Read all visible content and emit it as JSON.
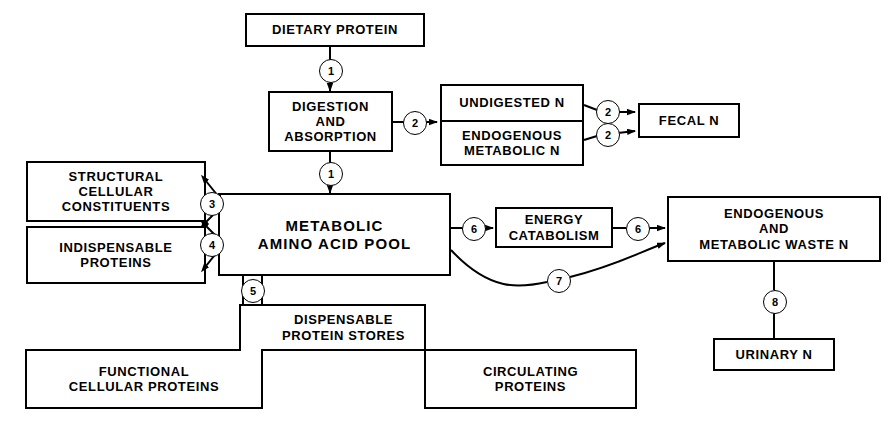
{
  "diagram": {
    "stroke_color": "#000000",
    "background_color": "#ffffff",
    "nodes": [
      {
        "id": "dietary-protein",
        "label": "DIETARY PROTEIN"
      },
      {
        "id": "digestion-and-absorption",
        "label": "DIGESTION\nAND\nABSORPTION"
      },
      {
        "id": "undigested-n",
        "label": "UNDIGESTED N"
      },
      {
        "id": "endogenous-metabolic-n",
        "label": "ENDOGENOUS\nMETABOLIC N"
      },
      {
        "id": "fecal-n",
        "label": "FECAL N"
      },
      {
        "id": "structural-cellular-constituents",
        "label": "STRUCTURAL\nCELLULAR\nCONSTITUENTS"
      },
      {
        "id": "indispensable-proteins",
        "label": "INDISPENSABLE\nPROTEINS"
      },
      {
        "id": "metabolic-amino-acid-pool",
        "label": "METABOLIC\nAMINO ACID POOL"
      },
      {
        "id": "energy-catabolism",
        "label": "ENERGY\nCATABOLISM"
      },
      {
        "id": "endogenous-and-metabolic-waste-n",
        "label": "ENDOGENOUS\nAND\nMETABOLIC WASTE N"
      },
      {
        "id": "urinary-n",
        "label": "URINARY N"
      },
      {
        "id": "dispensable-protein-stores",
        "label": "DISPENSABLE\nPROTEIN STORES"
      },
      {
        "id": "functional-cellular-proteins",
        "label": "FUNCTIONAL\nCELLULAR PROTEINS"
      },
      {
        "id": "circulating-proteins",
        "label": "CIRCULATING\nPROTEINS"
      }
    ],
    "markers": [
      {
        "id": "marker-1-top",
        "number": "1",
        "from": "dietary-protein",
        "to": "digestion-and-absorption"
      },
      {
        "id": "marker-2-undigested",
        "number": "2",
        "from": "digestion-and-absorption",
        "to": "undigested-n"
      },
      {
        "id": "marker-1-pool",
        "number": "1",
        "from": "digestion-and-absorption",
        "to": "metabolic-amino-acid-pool"
      },
      {
        "id": "marker-2-fecal-upper",
        "number": "2",
        "from": "undigested-n",
        "to": "fecal-n"
      },
      {
        "id": "marker-2-fecal-lower",
        "number": "2",
        "from": "endogenous-metabolic-n",
        "to": "fecal-n"
      },
      {
        "id": "marker-3",
        "number": "3",
        "from": "structural-cellular-constituents",
        "to": "metabolic-amino-acid-pool"
      },
      {
        "id": "marker-4",
        "number": "4",
        "from": "indispensable-proteins",
        "to": "metabolic-amino-acid-pool"
      },
      {
        "id": "marker-5",
        "number": "5",
        "from": "metabolic-amino-acid-pool",
        "to": "dispensable-protein-stores"
      },
      {
        "id": "marker-6-left",
        "number": "6",
        "from": "metabolic-amino-acid-pool",
        "to": "energy-catabolism"
      },
      {
        "id": "marker-6-right",
        "number": "6",
        "from": "energy-catabolism",
        "to": "endogenous-and-metabolic-waste-n"
      },
      {
        "id": "marker-7",
        "number": "7",
        "from": "metabolic-amino-acid-pool",
        "to": "endogenous-and-metabolic-waste-n"
      },
      {
        "id": "marker-8",
        "number": "8",
        "from": "endogenous-and-metabolic-waste-n",
        "to": "urinary-n"
      }
    ]
  }
}
